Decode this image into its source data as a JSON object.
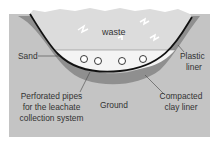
{
  "diagram": {
    "title": "",
    "labels": {
      "waste": "waste",
      "sand": "Sand",
      "plastic_liner_1": "Plastic",
      "plastic_liner_2": "liner",
      "pipes_1": "Perforated pipes",
      "pipes_2": "for the leachate",
      "pipes_3": "collection system",
      "ground": "Ground",
      "clay_1": "Compacted",
      "clay_2": "clay liner"
    },
    "colors": {
      "ground": "#c4c4c4",
      "clay": "#8f8f8f",
      "liner": "#111111",
      "sand": "#f4f4f4",
      "waste": "#dcdcdc",
      "background": "#ffffff"
    },
    "pipe_count": 4
  }
}
